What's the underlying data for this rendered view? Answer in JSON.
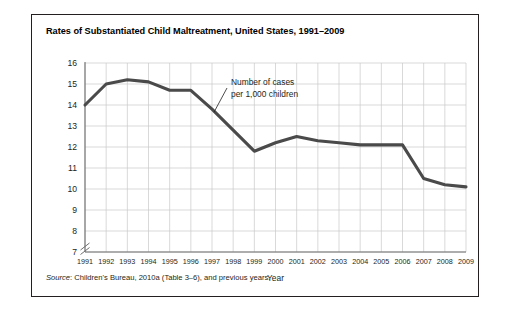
{
  "figure": {
    "title": "Rates of Substantiated Child Maltreatment, United States, 1991–2009",
    "source_label": "Source",
    "source_text": ": Children's Bureau, 2010a (Table 3–6), and previous years."
  },
  "colors": {
    "frame": "#231f20",
    "line": "#4a4a4a",
    "grid": "#c9c9c9",
    "axis": "#6f6f6f",
    "text": "#231f20",
    "background": "#ffffff"
  },
  "chart_data": {
    "type": "line",
    "title": "Rates of Substantiated Child Maltreatment, United States, 1991–2009",
    "xlabel": "Year",
    "ylabel": "",
    "grid": true,
    "legend": "none",
    "axis_break_y": true,
    "xlim": [
      1991,
      2009
    ],
    "ylim": [
      7,
      16
    ],
    "ytick_labels": [
      "16",
      "15",
      "14",
      "13",
      "12",
      "11",
      "10",
      "9",
      "8",
      "7"
    ],
    "yticks": [
      16,
      15,
      14,
      13,
      12,
      11,
      10,
      9,
      8,
      7
    ],
    "categories": [
      "1991",
      "1992",
      "1993",
      "1994",
      "1995",
      "1996",
      "1997",
      "1998",
      "1999",
      "2000",
      "2001",
      "2002",
      "2003",
      "2004",
      "2005",
      "2006",
      "2007",
      "2008",
      "2009"
    ],
    "series": [
      {
        "name": "Number of cases per 1,000 children",
        "values": [
          14.0,
          15.0,
          15.2,
          15.1,
          14.7,
          14.7,
          13.8,
          12.8,
          11.8,
          12.2,
          12.5,
          12.3,
          12.2,
          12.1,
          12.1,
          12.1,
          10.5,
          10.2,
          10.1
        ]
      }
    ],
    "annotations": [
      {
        "line1": "Number of cases",
        "line2": "per 1,000 children",
        "points_to": "1997"
      }
    ]
  }
}
